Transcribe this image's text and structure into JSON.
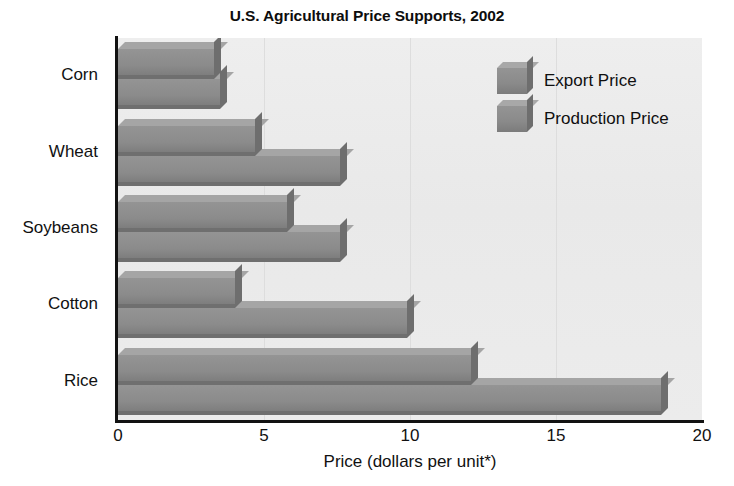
{
  "chart_data": {
    "type": "bar",
    "orientation": "horizontal",
    "title": "U.S. Agricultural Price Supports, 2002",
    "xlabel": "Price (dollars per unit*)",
    "ylabel": "",
    "xlim": [
      0,
      20
    ],
    "xticks": [
      "0",
      "5",
      "10",
      "15",
      "20"
    ],
    "xtick_values": [
      0,
      5,
      10,
      15,
      20
    ],
    "grid": "vertical-light",
    "legend_position": "inside-top-right",
    "categories": [
      "Corn",
      "Wheat",
      "Soybeans",
      "Cotton",
      "Rice"
    ],
    "series": [
      {
        "name": "Export Price",
        "color": "#8b8b8b",
        "values": [
          3.3,
          4.7,
          5.8,
          4.0,
          12.1
        ]
      },
      {
        "name": "Production Price",
        "color": "#8b8b8b",
        "values": [
          3.5,
          7.6,
          7.6,
          9.9,
          18.6
        ]
      }
    ]
  },
  "legend": {
    "entries": [
      {
        "label": "Export Price",
        "swatch": "bar-swatch-3d"
      },
      {
        "label": "Production Price",
        "swatch": "bar-swatch-3d"
      }
    ]
  },
  "colors": {
    "plot_background": "#ebebeb",
    "bar_fill": "#8b8b8b",
    "bar_top": "#a5a5a5",
    "bar_side": "#6e6e6e",
    "axis": "#121212",
    "gridline": "#dddddd",
    "text": "#111111"
  }
}
